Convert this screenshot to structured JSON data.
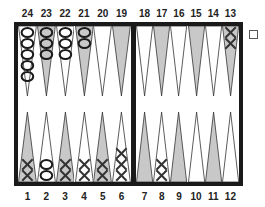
{
  "board": {
    "colors": {
      "frame": "#1a1a1a",
      "light_point": "#ffffff",
      "dark_point": "#c8c8c8",
      "point_stroke": "#333333",
      "checker_stroke": "#1a1a1a",
      "x_mark": "#333333"
    },
    "top_labels": [
      "24",
      "23",
      "22",
      "21",
      "20",
      "19",
      "18",
      "17",
      "16",
      "15",
      "14",
      "13"
    ],
    "bottom_labels": [
      "1",
      "2",
      "3",
      "4",
      "5",
      "6",
      "7",
      "8",
      "9",
      "10",
      "11",
      "12"
    ],
    "points": [
      {
        "point": 1,
        "player": "X",
        "count": 2
      },
      {
        "point": 2,
        "player": "O",
        "count": 2
      },
      {
        "point": 3,
        "player": "X",
        "count": 2
      },
      {
        "point": 4,
        "player": "X",
        "count": 2
      },
      {
        "point": 5,
        "player": "X",
        "count": 2
      },
      {
        "point": 6,
        "player": "X",
        "count": 3
      },
      {
        "point": 7,
        "player": null,
        "count": 0
      },
      {
        "point": 8,
        "player": "X",
        "count": 2
      },
      {
        "point": 9,
        "player": null,
        "count": 0
      },
      {
        "point": 10,
        "player": null,
        "count": 0
      },
      {
        "point": 11,
        "player": null,
        "count": 0
      },
      {
        "point": 12,
        "player": null,
        "count": 0
      },
      {
        "point": 13,
        "player": "X",
        "count": 2
      },
      {
        "point": 14,
        "player": null,
        "count": 0
      },
      {
        "point": 15,
        "player": null,
        "count": 0
      },
      {
        "point": 16,
        "player": null,
        "count": 0
      },
      {
        "point": 17,
        "player": null,
        "count": 0
      },
      {
        "point": 18,
        "player": null,
        "count": 0
      },
      {
        "point": 19,
        "player": null,
        "count": 0
      },
      {
        "point": 20,
        "player": null,
        "count": 0
      },
      {
        "point": 21,
        "player": "O",
        "count": 2
      },
      {
        "point": 22,
        "player": "O",
        "count": 3
      },
      {
        "point": 23,
        "player": "O",
        "count": 3
      },
      {
        "point": 24,
        "player": "O",
        "count": 5
      }
    ]
  },
  "doubling_cube": {
    "icon": "empty-square-checkbox"
  }
}
